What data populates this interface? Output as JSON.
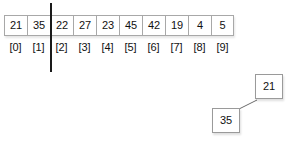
{
  "diagram": {
    "colors": {
      "cell_border": "#a8a8a8",
      "cell_fill": "#ffffff",
      "text": "#111111",
      "divider": "#1a1a1a",
      "node_border": "#9a9a9a",
      "connector": "#6b6b6b"
    },
    "array": {
      "values": [
        "21",
        "35",
        "22",
        "27",
        "23",
        "45",
        "42",
        "19",
        "4",
        "5"
      ],
      "indices": [
        "[0]",
        "[1]",
        "[2]",
        "[3]",
        "[4]",
        "[5]",
        "[6]",
        "[7]",
        "[8]",
        "[9]"
      ],
      "partition_after_index": 1
    },
    "tree": {
      "root": {
        "label": "21"
      },
      "child": {
        "label": "35"
      }
    }
  }
}
